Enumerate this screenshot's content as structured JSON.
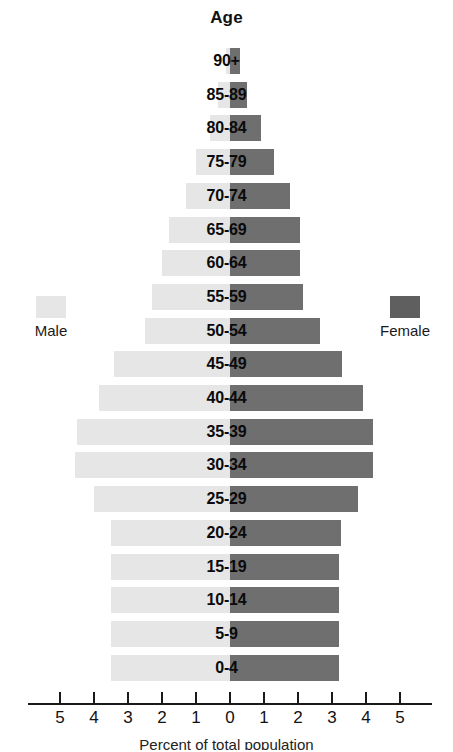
{
  "chart_data": {
    "type": "bar",
    "subtype": "population-pyramid",
    "title": "Age",
    "xlabel": "Percent of total population",
    "ylabel": "Age",
    "grid": false,
    "legend_position": "sides",
    "axis": {
      "tick_labels": [
        "5",
        "4",
        "3",
        "2",
        "1",
        "0",
        "1",
        "2",
        "3",
        "4",
        "5"
      ],
      "tick_values": [
        -5,
        -4,
        -3,
        -2,
        -1,
        0,
        1,
        2,
        3,
        4,
        5
      ],
      "xlim": [
        -5.5,
        5.5
      ],
      "center": 0
    },
    "categories": [
      "90+",
      "85-89",
      "80-84",
      "75-79",
      "70-74",
      "65-69",
      "60-64",
      "55-59",
      "50-54",
      "45-49",
      "40-44",
      "35-39",
      "30-34",
      "25-29",
      "20-24",
      "15-19",
      "10-14",
      "5-9",
      "0-4"
    ],
    "series": [
      {
        "name": "Male",
        "color": "#e6e6e6",
        "side": "left",
        "values": [
          0.12,
          0.35,
          0.6,
          1.0,
          1.3,
          1.8,
          2.0,
          2.3,
          2.5,
          3.4,
          3.85,
          4.5,
          4.55,
          4.0,
          3.5,
          3.5,
          3.5,
          3.5,
          3.5
        ]
      },
      {
        "name": "Female",
        "color": "#6f6f6f",
        "side": "right",
        "values": [
          0.3,
          0.5,
          0.9,
          1.3,
          1.75,
          2.05,
          2.05,
          2.15,
          2.65,
          3.3,
          3.9,
          4.2,
          4.2,
          3.75,
          3.25,
          3.2,
          3.2,
          3.2,
          3.2
        ]
      }
    ]
  },
  "legend": {
    "male": {
      "label": "Male",
      "color": "#e6e6e6"
    },
    "female": {
      "label": "Female",
      "color": "#5f5f5f"
    }
  }
}
